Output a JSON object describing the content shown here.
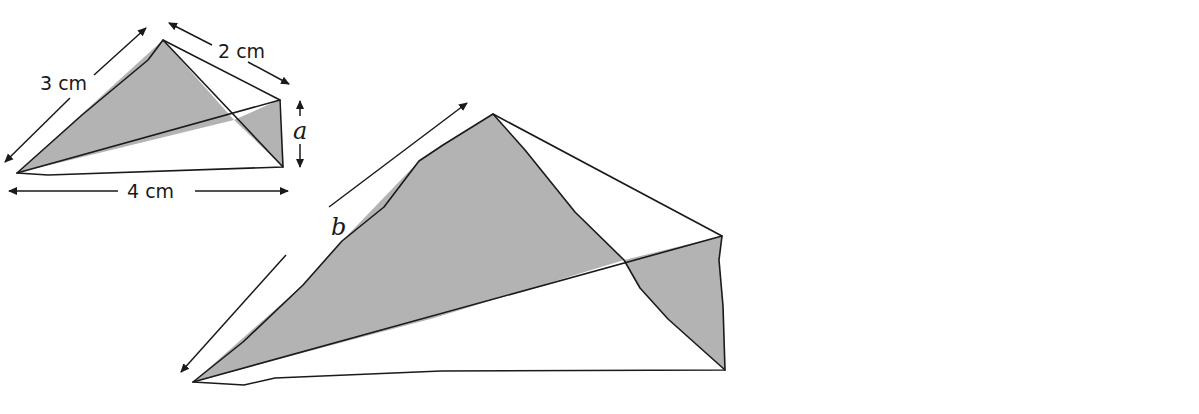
{
  "diagram": {
    "colors": {
      "shade": "#b3b3b3",
      "line": "#1a1a1a",
      "background": "#ffffff"
    },
    "shapes": [
      {
        "id": "small",
        "labels": {
          "slant_left": "3 cm",
          "slant_right": "2 cm",
          "height": "a",
          "base": "4 cm"
        }
      },
      {
        "id": "medium",
        "labels": {
          "slant_left": "b",
          "slant_right": "6 cm",
          "height": "3 cm",
          "base": "c"
        }
      },
      {
        "id": "large",
        "labels": {
          "slant_left": "d",
          "base": "8 cm"
        }
      }
    ]
  }
}
